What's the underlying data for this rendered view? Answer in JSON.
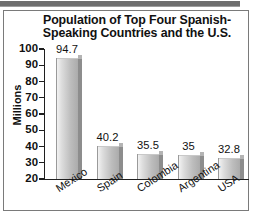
{
  "chart_data": {
    "type": "bar",
    "title_line1": "Population of Top Four Spanish-",
    "title_line2": "Speaking Countries and the U.S.",
    "xlabel": "",
    "ylabel": "Millions",
    "ylim": [
      20,
      100
    ],
    "ytick_step": 10,
    "grid": false,
    "legend": "none",
    "categories": [
      "Mexico",
      "Spain",
      "Colombia",
      "Argentina",
      "USA"
    ],
    "values": [
      94.7,
      40.2,
      35.5,
      35,
      32.8
    ],
    "value_labels": [
      "94.7",
      "40.2",
      "35.5",
      "35",
      "32.8"
    ],
    "ytick_labels": [
      "100",
      "90",
      "80",
      "70",
      "60",
      "50",
      "40",
      "30",
      "20"
    ],
    "colors": {
      "bar_face_light": "#f2f2f2",
      "bar_face_dark": "#a9a9a9",
      "bar_side": "#8d8d8d",
      "axis": "#1f1f1f",
      "text": "#111111",
      "frame": "#7a7a7a",
      "top_strip": "#6e6e6e",
      "background": "#ffffff"
    }
  }
}
